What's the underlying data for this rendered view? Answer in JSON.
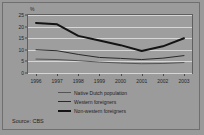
{
  "figure": {
    "unit_label": "%",
    "source_note": "Source: CBS"
  },
  "legend": {
    "items": [
      {
        "label": "Native Dutch population",
        "style": "thin"
      },
      {
        "label": "Western foreigners",
        "style": "mid"
      },
      {
        "label": "Non-western foreigners",
        "style": "thick"
      }
    ]
  },
  "chart_data": {
    "type": "line",
    "title": "",
    "subtitle": "",
    "xlabel": "",
    "ylabel": "%",
    "categories": [
      "1996",
      "1997",
      "1998",
      "1999",
      "2000",
      "2001",
      "2002",
      "2003"
    ],
    "x": [
      1996,
      1997,
      1998,
      1999,
      2000,
      2001,
      2002,
      2003
    ],
    "yticks": [
      0,
      5,
      10,
      15,
      20,
      25
    ],
    "ylim": [
      0,
      25
    ],
    "grid": true,
    "legend_position": "below",
    "annotations": [
      "Source: CBS"
    ],
    "series": [
      {
        "name": "Native Dutch population",
        "color": "#545454",
        "width": 1,
        "values": [
          6.0,
          5.8,
          5.3,
          4.7,
          4.3,
          4.0,
          4.1,
          4.5
        ]
      },
      {
        "name": "Western foreigners",
        "color": "#2a2a2a",
        "width": 1,
        "values": [
          10.0,
          9.6,
          8.0,
          6.7,
          6.3,
          5.8,
          6.4,
          7.5
        ]
      },
      {
        "name": "Non-western foreigners",
        "color": "#141414",
        "width": 2,
        "values": [
          21.6,
          21.0,
          16.0,
          14.0,
          12.0,
          9.5,
          11.5,
          15.0
        ]
      }
    ]
  }
}
